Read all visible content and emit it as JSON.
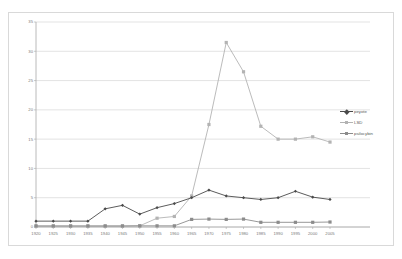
{
  "chart_data": {
    "type": "line",
    "title": "",
    "subtitle": "",
    "xlabel": "",
    "ylabel": "",
    "xlim": [
      1920,
      2005
    ],
    "ylim": [
      0,
      35
    ],
    "grid": true,
    "grid_axis": "y",
    "legend_position": "right",
    "categories": [
      "1920",
      "1925",
      "1930",
      "1935",
      "1940",
      "1945",
      "1950",
      "1955",
      "1960",
      "1965",
      "1970",
      "1975",
      "1980",
      "1985",
      "1990",
      "1995",
      "2000",
      "2005"
    ],
    "x_tick_labels": [
      "1920",
      "1925",
      "1930",
      "1935",
      "1940",
      "1945",
      "1950",
      "1955",
      "1960",
      "1965",
      "1970",
      "1975",
      "1980",
      "1985",
      "1990",
      "1995",
      "2000",
      "2005"
    ],
    "y_tick_labels": [
      "0",
      "5",
      "10",
      "15",
      "20",
      "25",
      "30",
      "35"
    ],
    "y_ticks": [
      0,
      5,
      10,
      15,
      20,
      25,
      30,
      35
    ],
    "series": [
      {
        "name": "peyote",
        "color": "#4a4a4a",
        "marker": "diamond",
        "values": [
          1.0,
          1.0,
          1.0,
          1.0,
          3.1,
          3.7,
          2.2,
          3.3,
          4.0,
          5.0,
          6.3,
          5.3,
          5.0,
          4.7,
          5.0,
          6.1,
          5.1,
          4.7
        ]
      },
      {
        "name": "LSD",
        "color": "#b3b3b3",
        "marker": "square",
        "values": [
          0.1,
          0.1,
          0.1,
          0.1,
          0.1,
          0.1,
          0.2,
          1.5,
          1.8,
          5.3,
          17.5,
          31.5,
          26.5,
          17.2,
          15.0,
          15.0,
          15.4,
          14.5
        ]
      },
      {
        "name": "psilocybin",
        "color": "#8c8c8c",
        "marker": "square",
        "values": [
          0.2,
          0.2,
          0.2,
          0.2,
          0.2,
          0.2,
          0.2,
          0.2,
          0.2,
          1.3,
          1.35,
          1.3,
          1.35,
          0.8,
          0.8,
          0.8,
          0.8,
          0.85
        ]
      }
    ],
    "series_points": {
      "peyote": [
        [
          1920,
          1.0
        ],
        [
          1925,
          1.0
        ],
        [
          1930,
          1.0
        ],
        [
          1935,
          1.0
        ],
        [
          1940,
          3.1
        ],
        [
          1945,
          3.7
        ],
        [
          1950,
          2.2
        ],
        [
          1955,
          3.3
        ],
        [
          1960,
          4.0
        ],
        [
          1965,
          5.0
        ],
        [
          1970,
          6.3
        ],
        [
          1975,
          5.3
        ],
        [
          1980,
          5.0
        ],
        [
          1985,
          4.7
        ],
        [
          1990,
          5.0
        ],
        [
          1995,
          6.1
        ],
        [
          2000,
          5.1
        ],
        [
          2005,
          4.7
        ]
      ],
      "LSD": [
        [
          1920,
          0.1
        ],
        [
          1925,
          0.1
        ],
        [
          1930,
          0.1
        ],
        [
          1935,
          0.1
        ],
        [
          1940,
          0.1
        ],
        [
          1945,
          0.1
        ],
        [
          1950,
          0.2
        ],
        [
          1955,
          1.5
        ],
        [
          1960,
          1.8
        ],
        [
          1965,
          5.3
        ],
        [
          1970,
          17.5
        ],
        [
          1975,
          31.5
        ],
        [
          1980,
          26.5
        ],
        [
          1985,
          17.2
        ],
        [
          1990,
          15.0
        ],
        [
          1995,
          15.0
        ],
        [
          2000,
          15.4
        ],
        [
          2005,
          14.5
        ]
      ],
      "psilocybin": [
        [
          1920,
          0.2
        ],
        [
          1925,
          0.2
        ],
        [
          1930,
          0.2
        ],
        [
          1935,
          0.2
        ],
        [
          1940,
          0.2
        ],
        [
          1945,
          0.2
        ],
        [
          1950,
          0.2
        ],
        [
          1955,
          0.2
        ],
        [
          1960,
          0.2
        ],
        [
          1965,
          1.3
        ],
        [
          1970,
          1.35
        ],
        [
          1975,
          1.3
        ],
        [
          1980,
          1.35
        ],
        [
          1985,
          0.8
        ],
        [
          1990,
          0.8
        ],
        [
          1995,
          0.8
        ],
        [
          2000,
          0.8
        ],
        [
          2005,
          0.85
        ]
      ]
    }
  },
  "legend": {
    "items": [
      {
        "label": "peyote",
        "color": "#4a4a4a",
        "marker": "diamond"
      },
      {
        "label": "LSD",
        "color": "#b3b3b3",
        "marker": "square"
      },
      {
        "label": "psilocybin",
        "color": "#8c8c8c",
        "marker": "square"
      }
    ]
  },
  "colors": {
    "background": "#ffffff",
    "frame_border": "#d9d9d9",
    "gridline": "#d0d0d0",
    "axis": "#a8a8a8",
    "tick_text": "#7a7a7a",
    "peyote": "#4a4a4a",
    "lsd": "#b3b3b3",
    "psilocybin": "#8c8c8c"
  }
}
